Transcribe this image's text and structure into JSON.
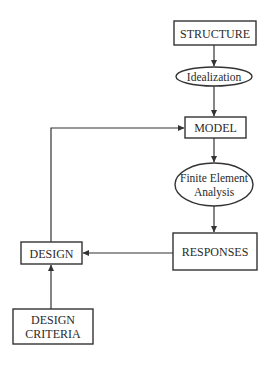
{
  "diagram": {
    "type": "flowchart",
    "nodes": {
      "structure": {
        "label": "STRUCTURE",
        "shape": "rectangle"
      },
      "idealization": {
        "label": "Idealization",
        "shape": "ellipse"
      },
      "model": {
        "label": "MODEL",
        "shape": "rectangle"
      },
      "fea": {
        "line1": "Finite Element",
        "line2": "Analysis",
        "shape": "ellipse"
      },
      "responses": {
        "label": "RESPONSES",
        "shape": "rectangle"
      },
      "design": {
        "label": "DESIGN",
        "shape": "rectangle"
      },
      "criteria": {
        "line1": "DESIGN",
        "line2": "CRITERIA",
        "shape": "rectangle"
      }
    },
    "edges": [
      {
        "from": "STRUCTURE",
        "to": "Idealization"
      },
      {
        "from": "Idealization",
        "to": "MODEL"
      },
      {
        "from": "MODEL",
        "to": "Finite Element Analysis"
      },
      {
        "from": "Finite Element Analysis",
        "to": "RESPONSES"
      },
      {
        "from": "RESPONSES",
        "to": "DESIGN"
      },
      {
        "from": "DESIGN CRITERIA",
        "to": "DESIGN"
      },
      {
        "from": "DESIGN",
        "to": "MODEL"
      }
    ],
    "colors": {
      "line": "#333333",
      "text": "#2a2a2a",
      "background": "#ffffff"
    }
  }
}
